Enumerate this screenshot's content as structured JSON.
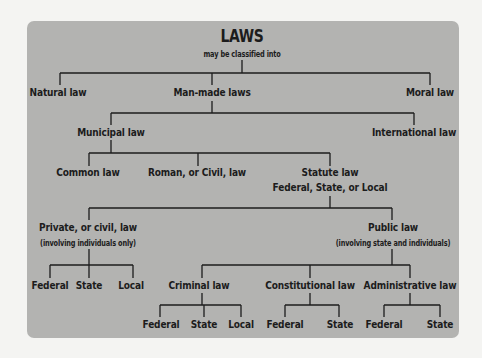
{
  "diagram": {
    "title": "LAWS",
    "subtitle": "may be classified into",
    "nodes": {
      "natural": "Natural law",
      "manmade": "Man-made laws",
      "moral": "Moral law",
      "municipal": "Municipal law",
      "international": "International law",
      "common": "Common law",
      "roman": "Roman, or Civil, law",
      "statute": "Statute law",
      "statute_sub": "Federal, State, or Local",
      "private": "Private, or civil, law",
      "private_sub": "(involving individuals only)",
      "public": "Public law",
      "public_sub": "(involving state and individuals)",
      "private_federal": "Federal",
      "private_state": "State",
      "private_local": "Local",
      "criminal": "Criminal law",
      "constitutional": "Constitutional law",
      "administrative": "Administrative law",
      "criminal_federal": "Federal",
      "criminal_state": "State",
      "criminal_local": "Local",
      "constitutional_federal": "Federal",
      "constitutional_state": "State",
      "administrative_federal": "Federal",
      "administrative_state": "State"
    },
    "colors": {
      "panel": "#b3b3b1",
      "line": "#1c1c1c",
      "background": "#f4f4f2"
    }
  }
}
